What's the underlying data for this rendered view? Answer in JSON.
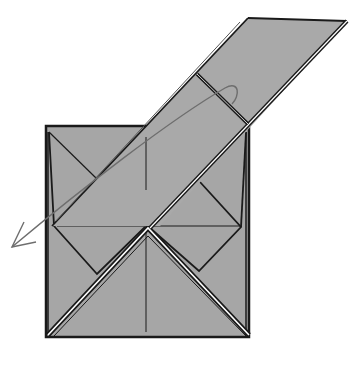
{
  "diagram": {
    "title": "Origami folding step",
    "colors": {
      "paper": "#a6a6a6",
      "paper_flap": "#a9a9a9",
      "line": "#1a1a1a",
      "arrow": "#6e6e6e",
      "highlight": "#ffffff",
      "background": "#ffffff"
    },
    "elements": [
      {
        "id": "base-square",
        "kind": "paper square"
      },
      {
        "id": "lifted-flap",
        "kind": "long diagonal flap"
      },
      {
        "id": "valley-fold-line",
        "kind": "dashed fold line"
      },
      {
        "id": "fold-arrow",
        "kind": "curved arrow toward lower-left"
      },
      {
        "id": "bottom-triangle",
        "kind": "white-edged inverted V layers"
      }
    ]
  }
}
